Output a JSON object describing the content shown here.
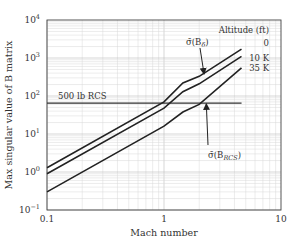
{
  "chart_data": {
    "type": "line",
    "title": "",
    "xlabel": "Mach number",
    "ylabel": "Max singular value of B matrix",
    "xscale": "log",
    "yscale": "log",
    "xlim": [
      0.1,
      10
    ],
    "ylim": [
      0.1,
      10000
    ],
    "grid": true,
    "x_ticks": [
      {
        "value": 0.1,
        "label": "0.1"
      },
      {
        "value": 1,
        "label": "1"
      },
      {
        "value": 10,
        "label": "10"
      }
    ],
    "y_ticks": [
      {
        "value": 0.1,
        "base": "10",
        "exp": "−1"
      },
      {
        "value": 1,
        "base": "10",
        "exp": "0"
      },
      {
        "value": 10,
        "base": "10",
        "exp": "1"
      },
      {
        "value": 100,
        "base": "10",
        "exp": "2"
      },
      {
        "value": 1000,
        "base": "10",
        "exp": "3"
      },
      {
        "value": 10000,
        "base": "10",
        "exp": "4"
      }
    ],
    "legend_title": "Altitude (ft)",
    "series": [
      {
        "name": "0",
        "label": "0",
        "points": [
          [
            0.1,
            1.3
          ],
          [
            1.0,
            70
          ],
          [
            1.45,
            220
          ],
          [
            2.0,
            330
          ],
          [
            4.6,
            1700
          ]
        ]
      },
      {
        "name": "10 K",
        "label": "10 K",
        "points": [
          [
            0.1,
            0.9
          ],
          [
            1.0,
            48
          ],
          [
            1.45,
            130
          ],
          [
            2.0,
            210
          ],
          [
            4.6,
            1100
          ]
        ]
      },
      {
        "name": "35 K",
        "label": "35 K",
        "points": [
          [
            0.1,
            0.3
          ],
          [
            1.0,
            16
          ],
          [
            1.45,
            38
          ],
          [
            2.0,
            60
          ],
          [
            4.6,
            550
          ]
        ]
      }
    ],
    "reference_lines": [
      {
        "name": "500 lb RCS",
        "label": "500 lb RCS",
        "y": 65,
        "x_range": [
          0.1,
          4.6
        ]
      }
    ],
    "annotations": [
      {
        "text_main": "σ̄(B",
        "subscript": "δ",
        "text_end": ")",
        "points_to": "0 ft / 10 K curves",
        "arrow_tip": [
          2.2,
          380
        ]
      },
      {
        "text_main": "σ̄(B",
        "subscript": "RCS",
        "text_end": ")",
        "points_to": "500 lb RCS line",
        "arrow_tip": [
          2.3,
          62
        ]
      }
    ]
  }
}
